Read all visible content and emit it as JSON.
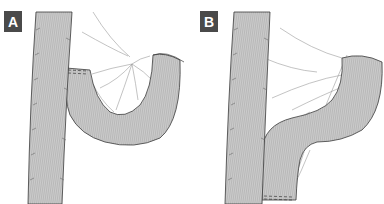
{
  "figure": {
    "panels": [
      {
        "id": "A",
        "label": "A",
        "description": "Straight segment with adjacent loop folded back as U/J shape; stapled end joined to side of straight segment near top"
      },
      {
        "id": "B",
        "label": "B",
        "description": "Straight segment with adjacent loop reshaped into S-curve; stapled end positioned at bottom beside straight segment"
      }
    ],
    "colors": {
      "tube_fill": "#c9c9c9",
      "tube_stripe": "#b5b5b5",
      "outline": "#3a3a3a",
      "fold_lines": "#9a9a9a",
      "label_bg": "#4a4a4a",
      "label_text": "#ffffff"
    }
  }
}
